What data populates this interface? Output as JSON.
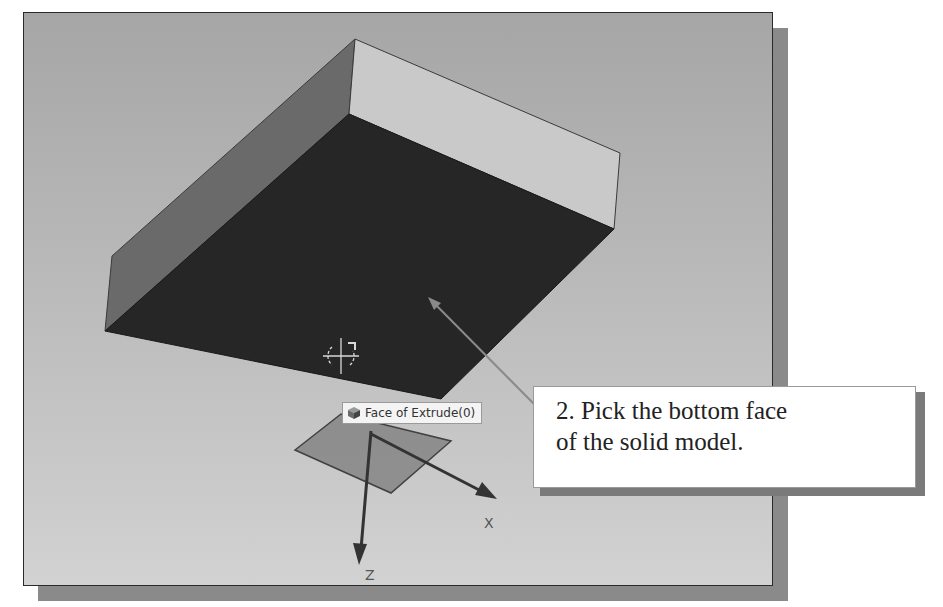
{
  "viewport": {
    "background_top": "#a6a6a6",
    "background_bottom": "#d2d2d2",
    "model": {
      "top_face_color": "#c9c9c9",
      "side_face_color": "#6a6a6a",
      "selected_face_color": "#262626"
    },
    "cursor": "select-crosshair",
    "tooltip": {
      "icon": "cube-icon",
      "label": "Face of Extrude(0)"
    },
    "triad": {
      "x_label": "X",
      "z_label": "Z",
      "plane_color": "#8c8c8c"
    }
  },
  "callout": {
    "line1": "2. Pick the bottom face",
    "line2": "of the solid model."
  }
}
